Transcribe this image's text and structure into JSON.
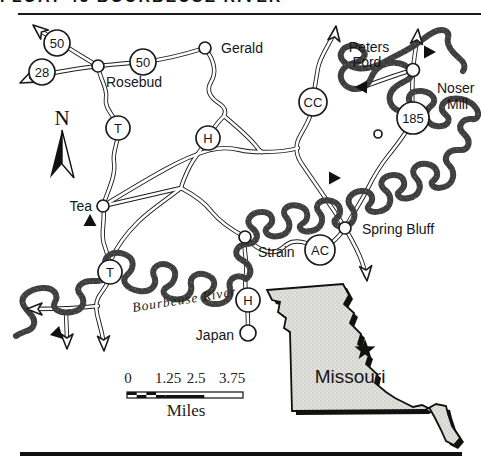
{
  "header": {
    "clipped_title": "FLOAT 45 BOURBEUSE RIVER"
  },
  "compass": {
    "north_label": "N"
  },
  "towns": {
    "gerald": "Gerald",
    "rosebud": "Rosebud",
    "tea": "Tea",
    "strain": "Strain",
    "spring_bluff": "Spring Bluff",
    "noser_mill_line1": "Noser",
    "noser_mill_line2": "Mill",
    "peters_ford_line1": "Peters",
    "peters_ford_line2": "Ford",
    "japan": "Japan"
  },
  "route_markers": {
    "hwy50_west": "50",
    "hwy28": "28",
    "hwy50_east": "50",
    "route_t_north": "T",
    "route_h_north": "H",
    "route_cc": "CC",
    "hwy185": "185",
    "route_ac": "AC",
    "route_t_south": "T",
    "route_h_south": "H"
  },
  "river": {
    "label": "Bourbeuse  River"
  },
  "scale_bar": {
    "ticks": [
      "0",
      "1.25",
      "2.5",
      "3.75"
    ],
    "unit_label": "Miles"
  },
  "inset": {
    "state_label": "Missouri"
  },
  "icons": {
    "north_arrow": "compass-arrow",
    "access_point": "filled-triangle",
    "road_continuation": "hollow-arrow",
    "location_star": "star"
  },
  "colors": {
    "ink": "#1b1b1b",
    "river": "#3e3e3e",
    "inset_fill": "#dcdcda",
    "paper": "#ffffff"
  }
}
